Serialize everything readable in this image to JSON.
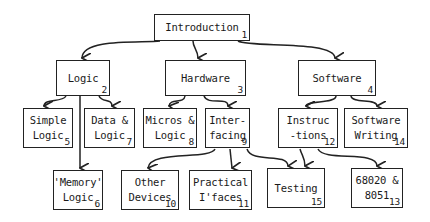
{
  "diagram": {
    "type": "tree",
    "nodes": [
      {
        "id": "introduction",
        "lines": [
          "Introduction"
        ],
        "number": "1",
        "x": 154,
        "y": 14,
        "w": 96,
        "h": 27
      },
      {
        "id": "logic",
        "lines": [
          "Logic"
        ],
        "number": "2",
        "x": 56,
        "y": 60,
        "w": 54,
        "h": 36
      },
      {
        "id": "hardware",
        "lines": [
          "Hardware"
        ],
        "number": "3",
        "x": 165,
        "y": 60,
        "w": 81,
        "h": 36
      },
      {
        "id": "software",
        "lines": [
          "Software"
        ],
        "number": "4",
        "x": 298,
        "y": 60,
        "w": 78,
        "h": 36
      },
      {
        "id": "simple-logic",
        "lines": [
          "Simple",
          "Logic"
        ],
        "number": "5",
        "x": 23,
        "y": 108,
        "w": 50,
        "h": 40
      },
      {
        "id": "data-logic",
        "lines": [
          "Data &",
          "Logic"
        ],
        "number": "7",
        "x": 84,
        "y": 108,
        "w": 51,
        "h": 40
      },
      {
        "id": "micros-logic",
        "lines": [
          "Micros &",
          "Logic"
        ],
        "number": "8",
        "x": 143,
        "y": 108,
        "w": 54,
        "h": 40
      },
      {
        "id": "interfacing",
        "lines": [
          "Inter-",
          "facing"
        ],
        "number": "9",
        "x": 205,
        "y": 108,
        "w": 45,
        "h": 40
      },
      {
        "id": "instructions",
        "lines": [
          "Instruc",
          "-tions"
        ],
        "number": "12",
        "x": 278,
        "y": 108,
        "w": 60,
        "h": 40
      },
      {
        "id": "software-writing",
        "lines": [
          "Software",
          "Writing"
        ],
        "number": "14",
        "x": 344,
        "y": 108,
        "w": 64,
        "h": 40
      },
      {
        "id": "memory-logic",
        "lines": [
          "'Memory'",
          "Logic"
        ],
        "number": "6",
        "x": 53,
        "y": 170,
        "w": 50,
        "h": 40
      },
      {
        "id": "other-devices",
        "lines": [
          "Other",
          "Devices"
        ],
        "number": "10",
        "x": 121,
        "y": 170,
        "w": 58,
        "h": 40
      },
      {
        "id": "practical-ifaces",
        "lines": [
          "Practical",
          "I'faces"
        ],
        "number": "11",
        "x": 189,
        "y": 170,
        "w": 63,
        "h": 40
      },
      {
        "id": "testing",
        "lines": [
          "Testing"
        ],
        "number": "15",
        "x": 267,
        "y": 168,
        "w": 58,
        "h": 40
      },
      {
        "id": "68020-8051",
        "lines": [
          "68020 &",
          "8051"
        ],
        "number": "13",
        "x": 351,
        "y": 168,
        "w": 52,
        "h": 40
      }
    ],
    "edges": [
      {
        "from": "introduction",
        "to": "logic",
        "d": "M160,41 C140,43 82,38 82,58"
      },
      {
        "from": "introduction",
        "to": "hardware",
        "d": "M193,41 C193,48 198,50 198,58"
      },
      {
        "from": "introduction",
        "to": "software",
        "d": "M238,41 C250,48 334,40 335,58"
      },
      {
        "from": "logic",
        "to": "simple-logic",
        "d": "M66,96 C62,103 44,98 44,106"
      },
      {
        "from": "logic",
        "to": "data-logic",
        "d": "M99,96 C102,103 112,98 112,106"
      },
      {
        "from": "logic",
        "to": "memory-logic",
        "d": "M80,96 L80,168"
      },
      {
        "from": "hardware",
        "to": "micros-logic",
        "d": "M185,96 C184,104 170,98 169,106"
      },
      {
        "from": "hardware",
        "to": "interfacing",
        "d": "M204,96 C208,106 228,96 228,106"
      },
      {
        "from": "software",
        "to": "instructions",
        "d": "M336,96 C336,104 306,100 306,106"
      },
      {
        "from": "software",
        "to": "software-writing",
        "d": "M351,96 C352,104 377,98 377,106"
      },
      {
        "from": "interfacing",
        "to": "other-devices",
        "d": "M215,149 C210,160 150,150 148,168"
      },
      {
        "from": "interfacing",
        "to": "practical-ifaces",
        "d": "M230,149 L232,168"
      },
      {
        "from": "interfacing",
        "to": "testing",
        "d": "M247,149 C252,164 287,152 288,166"
      },
      {
        "from": "instructions",
        "to": "testing",
        "d": "M300,149 C302,156 305,158 305,166"
      },
      {
        "from": "instructions",
        "to": "68020-8051",
        "d": "M318,149 C324,162 377,150 377,166"
      }
    ],
    "colors": {
      "stroke": "#222222",
      "background": "#ffffff",
      "text": "#1a1a1a"
    }
  }
}
